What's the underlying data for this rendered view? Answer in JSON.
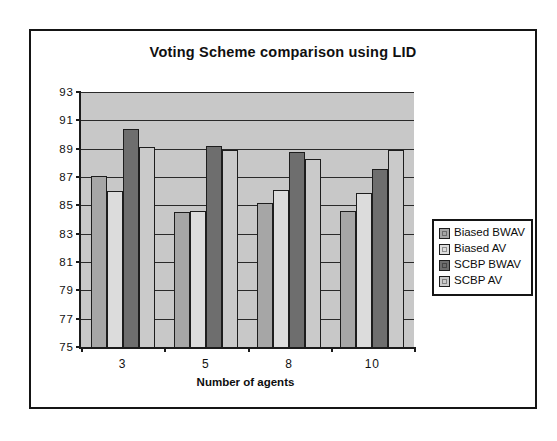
{
  "chart_data": {
    "type": "bar",
    "title": "Voting Scheme comparison using LID",
    "xlabel": "Number of agents",
    "ylabel": "",
    "categories": [
      "3",
      "5",
      "8",
      "10"
    ],
    "ylim": [
      75,
      93
    ],
    "ytick_step": 2,
    "yticks": [
      93,
      91,
      89,
      87,
      85,
      83,
      81,
      79,
      77,
      75
    ],
    "grid": true,
    "legend_position": "right",
    "series": [
      {
        "name": "Biased BWAV",
        "color": "#a6a6a6",
        "values": [
          87.05,
          84.5,
          85.2,
          84.6
        ]
      },
      {
        "name": "Biased AV",
        "color": "#dcdcdc",
        "values": [
          86.0,
          84.6,
          86.1,
          85.85
        ]
      },
      {
        "name": "SCBP BWAV",
        "color": "#6e6e6e",
        "values": [
          90.4,
          89.2,
          88.75,
          87.6
        ]
      },
      {
        "name": "SCBP AV",
        "color": "#cacaca",
        "values": [
          89.15,
          88.9,
          88.25,
          88.9
        ]
      }
    ]
  },
  "colors": {
    "plot_background": "#c8c8c8",
    "frame": "#151515",
    "axis": "#1b1b1b",
    "gridline": "#2a2a2a",
    "page_background": "#ffffff"
  }
}
